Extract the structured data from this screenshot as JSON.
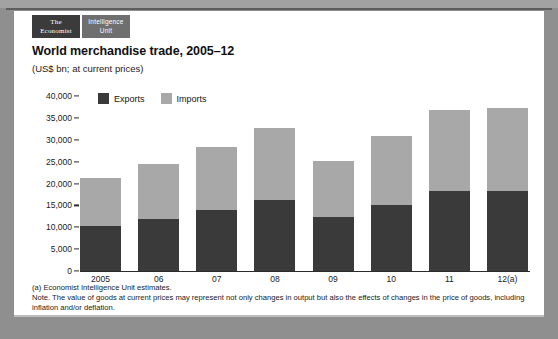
{
  "branding": {
    "primary_line1": "The",
    "primary_line2": "Economist",
    "secondary_line1": "Intelligence",
    "secondary_line2": "Unit"
  },
  "header": {
    "title": "World merchandise trade, 2005–12",
    "subtitle": "(US$ bn; at current prices)"
  },
  "footnotes": {
    "line1": "(a) Economist Intelligence Unit estimates.",
    "line2": "Note. The value of goods at current prices may represent not only changes in output but also the effects of changes in the price of goods, including",
    "line3": "inflation and/or deflation."
  },
  "colors": {
    "exports": "#3a3a3a",
    "imports": "#a8a8a8",
    "card": "#ffffff",
    "page": "#8f8f8f",
    "axis": "#2b2b2b"
  },
  "chart_data": {
    "type": "bar",
    "title": "World merchandise trade, 2005–12",
    "subtitle": "(US$ bn; at current prices)",
    "stacked": true,
    "xlabel": "",
    "ylabel": "",
    "ylim": [
      0,
      40000
    ],
    "yticks": [
      0,
      5000,
      10000,
      15000,
      20000,
      25000,
      30000,
      35000,
      40000
    ],
    "ytick_labels": [
      "0",
      "5,000",
      "10,000",
      "15,000",
      "20,000",
      "25,000",
      "30,000",
      "35,000",
      "40,000"
    ],
    "grid": false,
    "legend_position": "top-left",
    "categories": [
      "2005",
      "06",
      "07",
      "08",
      "09",
      "10",
      "11",
      "12(a)"
    ],
    "series": [
      {
        "name": "Exports",
        "color": "#3a3a3a",
        "values": [
          10400,
          12000,
          13900,
          16200,
          12300,
          15000,
          18200,
          18400
        ]
      },
      {
        "name": "Imports",
        "color": "#a8a8a8",
        "values": [
          10800,
          12500,
          14400,
          16500,
          12900,
          15800,
          18500,
          18800
        ]
      }
    ],
    "totals": [
      21200,
      24500,
      28300,
      32700,
      25200,
      30800,
      36700,
      37200
    ]
  }
}
